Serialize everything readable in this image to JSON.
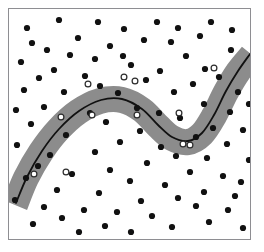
{
  "figure": {
    "title": "",
    "width": 264,
    "height": 252,
    "background_color": "#ffffff"
  },
  "frame": {
    "x": 8,
    "y": 8,
    "width": 243,
    "height": 232,
    "border_color": "#8e8e92",
    "fill_color": "#ffffff"
  },
  "chart_data": {
    "type": "scatter",
    "title": "",
    "subtitle": "",
    "xlabel": "",
    "ylabel": "",
    "xlim": [
      0,
      264
    ],
    "ylim": [
      0,
      252
    ],
    "grid": false,
    "legend": null,
    "annotations": [],
    "series": [
      {
        "name": "data-points",
        "marker": "filled-circle",
        "color": "#111111",
        "radius": 3.1,
        "points": [
          [
            27,
            28
          ],
          [
            59,
            20
          ],
          [
            98,
            22
          ],
          [
            124,
            29
          ],
          [
            157,
            22
          ],
          [
            178,
            28
          ],
          [
            211,
            22
          ],
          [
            200,
            36
          ],
          [
            32,
            43
          ],
          [
            78,
            38
          ],
          [
            144,
            40
          ],
          [
            232,
            30
          ],
          [
            47,
            50
          ],
          [
            110,
            46
          ],
          [
            171,
            42
          ],
          [
            95,
            59
          ],
          [
            21,
            62
          ],
          [
            70,
            55
          ],
          [
            123,
            56
          ],
          [
            231,
            50
          ],
          [
            54,
            70
          ],
          [
            131,
            65
          ],
          [
            186,
            56
          ],
          [
            205,
            69
          ],
          [
            39,
            78
          ],
          [
            85,
            76
          ],
          [
            160,
            71
          ],
          [
            219,
            77
          ],
          [
            24,
            90
          ],
          [
            100,
            86
          ],
          [
            146,
            80
          ],
          [
            193,
            84
          ],
          [
            64,
            92
          ],
          [
            118,
            93
          ],
          [
            174,
            92
          ],
          [
            238,
            92
          ],
          [
            16,
            110
          ],
          [
            44,
            107
          ],
          [
            137,
            108
          ],
          [
            204,
            104
          ],
          [
            90,
            113
          ],
          [
            159,
            113
          ],
          [
            230,
            112
          ],
          [
            249,
            104
          ],
          [
            31,
            124
          ],
          [
            106,
            122
          ],
          [
            180,
            118
          ],
          [
            213,
            128
          ],
          [
            140,
            131
          ],
          [
            243,
            130
          ],
          [
            66,
            135
          ],
          [
            196,
            137
          ],
          [
            17,
            145
          ],
          [
            120,
            142
          ],
          [
            161,
            147
          ],
          [
            227,
            144
          ],
          [
            50,
            155
          ],
          [
            95,
            152
          ],
          [
            176,
            156
          ],
          [
            207,
            158
          ],
          [
            38,
            166
          ],
          [
            147,
            163
          ],
          [
            249,
            160
          ],
          [
            110,
            170
          ],
          [
            26,
            178
          ],
          [
            72,
            174
          ],
          [
            190,
            172
          ],
          [
            223,
            176
          ],
          [
            130,
            181
          ],
          [
            165,
            185
          ],
          [
            241,
            182
          ],
          [
            57,
            190
          ],
          [
            99,
            193
          ],
          [
            204,
            192
          ],
          [
            235,
            196
          ],
          [
            15,
            200
          ],
          [
            141,
            201
          ],
          [
            178,
            198
          ],
          [
            44,
            207
          ],
          [
            84,
            210
          ],
          [
            117,
            212
          ],
          [
            196,
            206
          ],
          [
            228,
            210
          ],
          [
            62,
            218
          ],
          [
            152,
            216
          ],
          [
            209,
            222
          ],
          [
            33,
            224
          ],
          [
            105,
            226
          ],
          [
            172,
            227
          ],
          [
            131,
            232
          ],
          [
            243,
            228
          ],
          [
            79,
            232
          ]
        ]
      },
      {
        "name": "support-vectors",
        "marker": "hollow-circle",
        "color": "#2b2b2b",
        "fill": "#ffffff",
        "radius": 2.9,
        "points": [
          [
            34,
            174
          ],
          [
            66,
            172
          ],
          [
            61,
            117
          ],
          [
            92,
            115
          ],
          [
            88,
            84
          ],
          [
            124,
            77
          ],
          [
            135,
            81
          ],
          [
            137,
            115
          ],
          [
            179,
            113
          ],
          [
            183,
            144
          ],
          [
            190,
            145
          ],
          [
            214,
            68
          ]
        ]
      }
    ],
    "band": {
      "name": "margin-band",
      "color": "#8c8c8c",
      "thickness": 26,
      "path": [
        [
          15,
          205
        ],
        [
          26,
          178
        ],
        [
          41,
          152
        ],
        [
          58,
          130
        ],
        [
          78,
          112
        ],
        [
          100,
          101
        ],
        [
          122,
          100
        ],
        [
          142,
          110
        ],
        [
          158,
          126
        ],
        [
          172,
          138
        ],
        [
          188,
          142
        ],
        [
          202,
          134
        ],
        [
          214,
          116
        ],
        [
          226,
          92
        ],
        [
          238,
          72
        ],
        [
          252,
          55
        ]
      ]
    },
    "boundary": {
      "name": "decision-boundary",
      "color": "#111111",
      "width": 1.8,
      "path": [
        [
          16,
          203
        ],
        [
          27,
          177
        ],
        [
          42,
          151
        ],
        [
          59,
          129
        ],
        [
          79,
          111
        ],
        [
          101,
          100
        ],
        [
          122,
          99
        ],
        [
          142,
          109
        ],
        [
          158,
          125
        ],
        [
          172,
          137
        ],
        [
          188,
          141
        ],
        [
          202,
          133
        ],
        [
          214,
          115
        ],
        [
          226,
          91
        ],
        [
          238,
          71
        ],
        [
          250,
          54
        ]
      ]
    }
  }
}
